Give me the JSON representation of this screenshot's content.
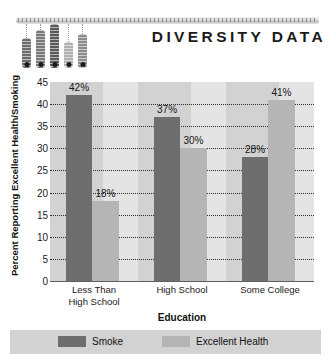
{
  "header": {
    "brand_title": "DIVERSITY DATA",
    "ruler_icon": "ruler-bar",
    "thermometers": [
      {
        "name": "thermometer-1",
        "height": 30,
        "shade": "#6d6d6d"
      },
      {
        "name": "thermometer-2",
        "height": 38,
        "shade": "#7a7a7a"
      },
      {
        "name": "thermometer-3",
        "height": 44,
        "shade": "#5a5a5a"
      },
      {
        "name": "thermometer-4",
        "height": 26,
        "shade": "#b0b0b0"
      },
      {
        "name": "thermometer-5",
        "height": 34,
        "shade": "#8d8d8d"
      }
    ]
  },
  "chart_data": {
    "type": "bar",
    "title": "DIVERSITY DATA",
    "xlabel": "Education",
    "ylabel": "Percent Reporting Excellent Health/Smoking",
    "categories": [
      "Less Than High School",
      "High School",
      "Some College"
    ],
    "category_lines": [
      [
        "Less Than",
        "High School"
      ],
      [
        "High School"
      ],
      [
        "Some College"
      ]
    ],
    "series": [
      {
        "name": "Smoke",
        "color": "#6e6e6e",
        "values": [
          42,
          37,
          28
        ],
        "labels": [
          "42%",
          "37%",
          "28%"
        ]
      },
      {
        "name": "Excellent Health",
        "color": "#b5b5b5",
        "values": [
          18,
          30,
          41
        ],
        "labels": [
          "18%",
          "30%",
          "41%"
        ]
      }
    ],
    "ylim": [
      0,
      45
    ],
    "yticks": [
      0,
      5,
      10,
      15,
      20,
      25,
      30,
      35,
      40,
      45
    ],
    "ytick_labels": [
      "0",
      "5",
      "10",
      "15",
      "20",
      "25",
      "30",
      "35",
      "40",
      "45"
    ],
    "grid": true,
    "grid_style": "dotted-horizontal",
    "legend_position": "bottom",
    "plot_background": "#d2d2d2",
    "legend_background": "#d2d2d2"
  },
  "legend": {
    "entries": [
      {
        "label": "Smoke",
        "swatch": "smoke"
      },
      {
        "label": "Excellent Health",
        "swatch": "health"
      }
    ]
  }
}
